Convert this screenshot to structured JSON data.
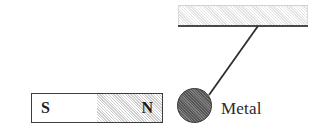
{
  "figure": {
    "background_color": "#ffffff",
    "width": 310,
    "height": 134
  },
  "ceiling": {
    "name": "ceiling-support",
    "fill_color": "#e6e6e6",
    "edge_color": "#4a4a4a",
    "hatched": true
  },
  "string": {
    "name": "suspension-string",
    "color": "#2e2e2e",
    "anchor_top": {
      "x": 258,
      "y": 26
    },
    "anchor_bottom": {
      "x": 209,
      "y": 95
    }
  },
  "sphere": {
    "name": "metal-sphere",
    "label": "Metal",
    "fill_color": "#6a6a6a",
    "stroke_color": "#3c3c3c",
    "diameter": 35,
    "center": {
      "x": 194,
      "y": 105
    }
  },
  "magnet": {
    "name": "bar-magnet",
    "border_color": "#3d3d3d",
    "poles": [
      {
        "letter": "S",
        "name": "south-pole",
        "fill_color": "#ffffff"
      },
      {
        "letter": "N",
        "name": "north-pole",
        "fill_color": "#d8d8d8"
      }
    ]
  }
}
